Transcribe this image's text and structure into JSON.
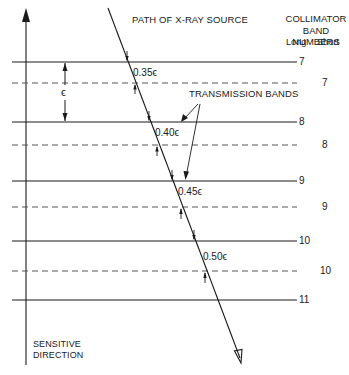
{
  "diagram": {
    "path_label": "PATH OF X-RAY SOURCE",
    "collimator_header": {
      "line1": "COLLIMATOR",
      "line2": "BAND NUMBERS",
      "long": "Long",
      "short": "Short"
    },
    "transmission_label": "TRANSMISSION BANDS",
    "epsilon_label": "ϵ",
    "axis_label": {
      "line1": "SENSITIVE",
      "line2": "DIRECTION"
    },
    "long_bands": [
      {
        "number": "7",
        "y": 62
      },
      {
        "number": "8",
        "y": 122
      },
      {
        "number": "9",
        "y": 181
      },
      {
        "number": "10",
        "y": 241
      },
      {
        "number": "11",
        "y": 300
      }
    ],
    "short_bands": [
      {
        "number": "7",
        "y": 83
      },
      {
        "number": "8",
        "y": 145
      },
      {
        "number": "9",
        "y": 207
      },
      {
        "number": "10",
        "y": 271
      }
    ],
    "band_widths": [
      {
        "label": "0.35ϵ"
      },
      {
        "label": "0.40ϵ"
      },
      {
        "label": "0.45ϵ"
      },
      {
        "label": "0.50ϵ"
      }
    ],
    "colors": {
      "line": "#1a1a1a",
      "dashed": "#555555",
      "background": "#ffffff"
    }
  }
}
